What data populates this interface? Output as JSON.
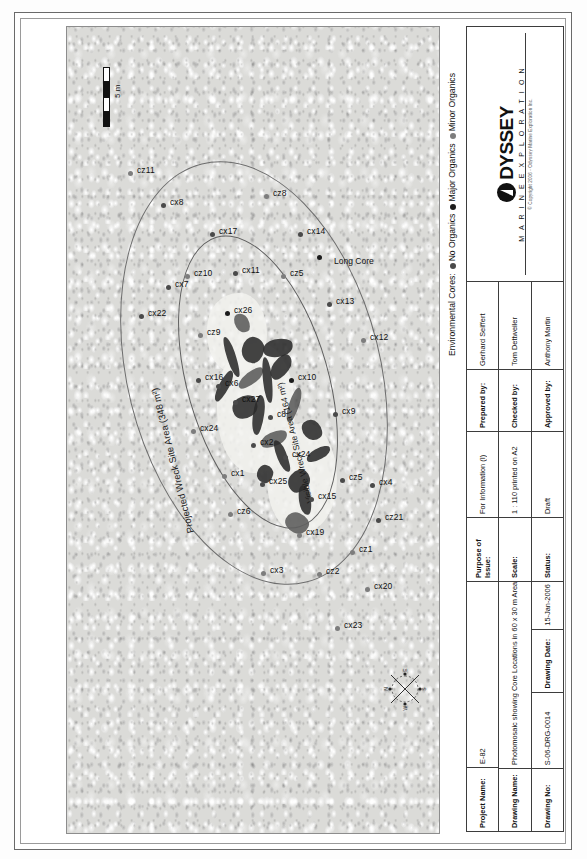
{
  "legend": {
    "title": "Environmental Cores:",
    "entries": [
      {
        "label": "No Organics",
        "color": "#4a4a4a"
      },
      {
        "label": "Major Organics",
        "color": "#1c1c1c"
      },
      {
        "label": "Minor Organics",
        "color": "#7d7d7d"
      }
    ]
  },
  "map": {
    "projected_area_label": "Projected Wreck Site Area (348 m²)",
    "visible_area_label": "Visible Wreck Site Area (164 m²)",
    "long_core_label": "Long Core",
    "scale_label": "5 m",
    "compass": {
      "n": "N",
      "e": "E",
      "s": "S",
      "w": "W"
    },
    "cores": [
      {
        "id": "cz11",
        "x": 659,
        "y": 63,
        "type": "minor"
      },
      {
        "id": "cx8",
        "x": 627,
        "y": 96,
        "type": "no"
      },
      {
        "id": "cz10",
        "x": 556,
        "y": 120,
        "type": "minor"
      },
      {
        "id": "cx22",
        "x": 516,
        "y": 74,
        "type": "no"
      },
      {
        "id": "cx7",
        "x": 545,
        "y": 101,
        "type": "no"
      },
      {
        "id": "cz9",
        "x": 497,
        "y": 133,
        "type": "minor"
      },
      {
        "id": "cx17",
        "x": 598,
        "y": 145,
        "type": "no"
      },
      {
        "id": "cz8",
        "x": 636,
        "y": 199,
        "type": "minor"
      },
      {
        "id": "cx16",
        "x": 452,
        "y": 131,
        "type": "no"
      },
      {
        "id": "cx6",
        "x": 446,
        "y": 151,
        "type": "no"
      },
      {
        "id": "cx26",
        "x": 519,
        "y": 160,
        "type": "major"
      },
      {
        "id": "cx11",
        "x": 559,
        "y": 168,
        "type": "no"
      },
      {
        "id": "cx24",
        "x": 401,
        "y": 126,
        "type": "minor"
      },
      {
        "id": "cx27",
        "x": 430,
        "y": 168,
        "type": "no"
      },
      {
        "id": "cx14",
        "x": 598,
        "y": 233,
        "type": "no"
      },
      {
        "id": "cz5",
        "x": 556,
        "y": 216,
        "type": "minor"
      },
      {
        "id": "cx1",
        "x": 356,
        "y": 157,
        "type": "minor"
      },
      {
        "id": "cx2",
        "x": 387,
        "y": 186,
        "type": "no"
      },
      {
        "id": "cz6",
        "x": 318,
        "y": 163,
        "type": "minor"
      },
      {
        "id": "cx25",
        "x": 348,
        "y": 195,
        "type": "no"
      },
      {
        "id": "cx24b",
        "x": 375,
        "y": 218,
        "type": "no"
      },
      {
        "id": "cx10",
        "x": 452,
        "y": 224,
        "type": "major"
      },
      {
        "id": "c8",
        "x": 415,
        "y": 203,
        "type": "no"
      },
      {
        "id": "cx13",
        "x": 528,
        "y": 262,
        "type": "no"
      },
      {
        "id": "cx12",
        "x": 492,
        "y": 296,
        "type": "minor"
      },
      {
        "id": "cx3",
        "x": 259,
        "y": 196,
        "type": "minor"
      },
      {
        "id": "cx15",
        "x": 333,
        "y": 244,
        "type": "no"
      },
      {
        "id": "cx9",
        "x": 418,
        "y": 268,
        "type": "no"
      },
      {
        "id": "cz5b",
        "x": 352,
        "y": 275,
        "type": "no"
      },
      {
        "id": "cx19",
        "x": 297,
        "y": 232,
        "type": "minor"
      },
      {
        "id": "cz2",
        "x": 258,
        "y": 252,
        "type": "minor"
      },
      {
        "id": "cz1",
        "x": 280,
        "y": 285,
        "type": "minor"
      },
      {
        "id": "cx4",
        "x": 347,
        "y": 305,
        "type": "no"
      },
      {
        "id": "cz21",
        "x": 312,
        "y": 311,
        "type": "no"
      },
      {
        "id": "cx20",
        "x": 243,
        "y": 300,
        "type": "minor"
      },
      {
        "id": "cx23",
        "x": 204,
        "y": 270,
        "type": "minor"
      },
      {
        "id": "longcore",
        "x": 575,
        "y": 252,
        "type": "major"
      }
    ]
  },
  "title_block": {
    "project_name_key": "Project Name:",
    "project_name_val": "E-82",
    "drawing_name_key": "Drawing Name:",
    "drawing_name_val": "Photomosaic showing Core Locations in 60 x 30 m Area",
    "drawing_no_key": "Drawing No:",
    "drawing_no_val": "S-06-DRG-0014",
    "drawing_date_key": "Drawing Date:",
    "drawing_date_val": "15-Jan-2006",
    "purpose_key": "Purpose of Issue:",
    "purpose_val": "For Information (I)",
    "scale_key": "Scale:",
    "scale_val": "1 : 110 printed on A2",
    "status_key": "Status:",
    "status_val": "Draft",
    "prepared_key": "Prepared by:",
    "prepared_val": "Gerhard Seiffert",
    "checked_key": "Checked by:",
    "checked_val": "Tom Dettweiler",
    "approved_key": "Approved by:",
    "approved_val": "Anthony Martin",
    "logo_word": "DYSSEY",
    "logo_sub": "M A R I N E   E X P L O R A T I O N",
    "copyright": "© Copyright 2006 - Odyssey Marine Exploration Inc."
  }
}
